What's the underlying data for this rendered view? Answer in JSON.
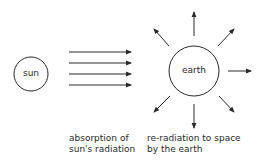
{
  "diagram": {
    "colors": {
      "stroke": "#2a2a2a",
      "background": "#ffffff"
    },
    "sun": {
      "label": "sun",
      "center": [
        31,
        74
      ],
      "radius": 17
    },
    "incoming_rays": {
      "count": 4,
      "x_start": 69,
      "x_end": 131,
      "y_positions": [
        52,
        63,
        74,
        85
      ]
    },
    "earth": {
      "label": "earth",
      "center": [
        194,
        71
      ],
      "radius": 25
    },
    "outgoing_rays": [
      {
        "direction": "up",
        "from": [
          194,
          36
        ],
        "to": [
          194,
          12
        ]
      },
      {
        "direction": "up-right",
        "from": [
          218,
          46
        ],
        "to": [
          234,
          29
        ]
      },
      {
        "direction": "right",
        "from": [
          228,
          71
        ],
        "to": [
          251,
          71
        ]
      },
      {
        "direction": "down-right",
        "from": [
          219,
          96
        ],
        "to": [
          234,
          112
        ]
      },
      {
        "direction": "down",
        "from": [
          194,
          104
        ],
        "to": [
          194,
          128
        ]
      },
      {
        "direction": "down-left",
        "from": [
          170,
          96
        ],
        "to": [
          154,
          112
        ]
      },
      {
        "direction": "up-left",
        "from": [
          169,
          46
        ],
        "to": [
          154,
          29
        ]
      }
    ],
    "captions": {
      "absorption": {
        "line1": "absorption of",
        "line2": "sun's radiation"
      },
      "reradiation": {
        "line1": "re-radiation to space",
        "line2": "by the earth"
      }
    }
  }
}
